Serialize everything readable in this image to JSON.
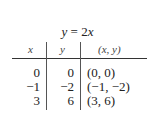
{
  "table": {
    "title_y": "y",
    "title_eq": " = 2",
    "title_x": "x",
    "headers": [
      "x",
      "y",
      "(x, y)"
    ],
    "rows": [
      {
        "x": "0",
        "y": "0",
        "pair": "(0, 0)"
      },
      {
        "x": "−1",
        "y": "−2",
        "pair": "(−1, −2)"
      },
      {
        "x": "3",
        "y": "6",
        "pair": "(3, 6)"
      }
    ]
  }
}
